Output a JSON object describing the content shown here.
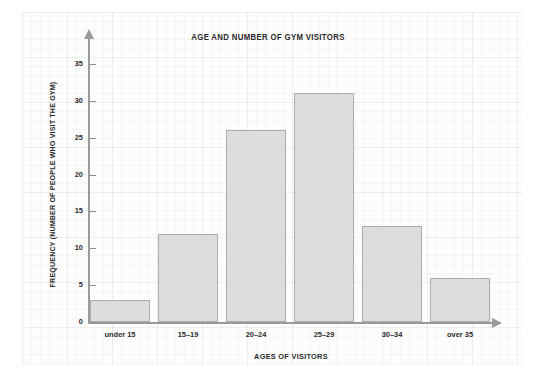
{
  "chart_data": {
    "type": "bar",
    "title": "AGE AND NUMBER OF GYM VISITORS",
    "xlabel": "AGES OF VISITORS",
    "ylabel": "FREQUENCY (NUMBER OF PEOPLE WHO VISIT THE GYM)",
    "categories": [
      "under 15",
      "15–19",
      "20–24",
      "25–29",
      "30–34",
      "over 35"
    ],
    "values": [
      3,
      12,
      26,
      31,
      13,
      6
    ],
    "ylim": [
      0,
      35
    ],
    "yticks": [
      0,
      5,
      10,
      15,
      20,
      25,
      30,
      35
    ],
    "ytick_labels": [
      "0",
      "5",
      "10",
      "15",
      "20",
      "25",
      "30",
      "35"
    ],
    "grid": false,
    "legend": "none",
    "bar_fill_color": "#dcdcdc",
    "bar_border_color": "#adadad",
    "axis_color": "#9a9a9a",
    "text_color": "#2b2b2b",
    "background_color": "#fdfdfe"
  }
}
